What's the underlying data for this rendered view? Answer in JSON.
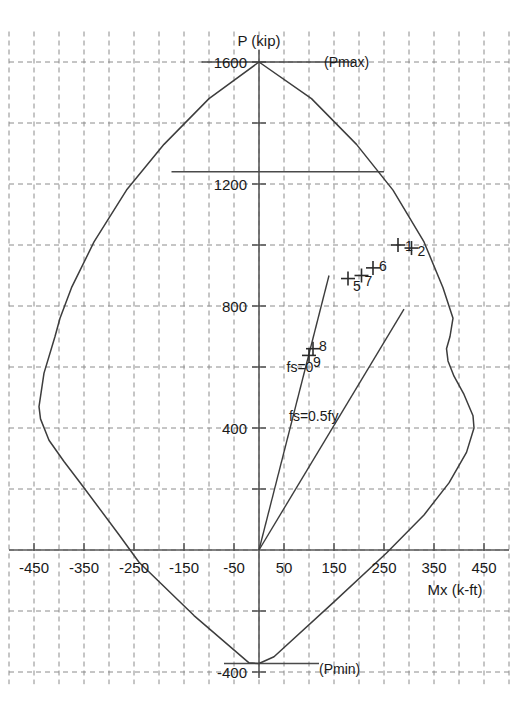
{
  "chart_data": {
    "type": "line",
    "title": "",
    "xlabel": "Mx (k-ft)",
    "ylabel": "P (kip)",
    "xlim": [
      -500,
      500
    ],
    "ylim": [
      -440,
      1700
    ],
    "grid": true,
    "legend_position": "none",
    "x_ticks": [
      -450,
      -350,
      -250,
      -150,
      -50,
      50,
      150,
      250,
      350,
      450
    ],
    "x_tick_labels": [
      "-450",
      "-350",
      "-250",
      "-150",
      "-50",
      "50",
      "150",
      "250",
      "350",
      "450"
    ],
    "y_ticks": [
      1600,
      1200,
      800,
      400,
      -400
    ],
    "y_tick_labels": [
      "1600",
      "1200",
      "800",
      "400",
      "-400"
    ],
    "x_minor_step": 50,
    "y_minor_step": 200,
    "annotations": [
      {
        "name": "pmax-label",
        "text": "(Pmax)",
        "x": 130,
        "y": 1600
      },
      {
        "name": "pmin-label",
        "text": "(Pmin)",
        "x": 120,
        "y": -390
      },
      {
        "name": "fs0-label",
        "text": "fs=0",
        "x": 55,
        "y": 600
      },
      {
        "name": "fs05fy-label",
        "text": "fs=0.5fy",
        "x": 60,
        "y": 440
      }
    ],
    "cap_lines": [
      {
        "name": "pmax-cap-line",
        "y": 1600,
        "x_start": -115,
        "x_end": 190
      },
      {
        "name": "phi-pn-cap-line",
        "y": 1240,
        "x_start": -175,
        "x_end": 250
      },
      {
        "name": "pmin-cap-line",
        "y": -372,
        "x_start": -70,
        "x_end": 120
      }
    ],
    "rays": [
      {
        "name": "fs-equal-zero-ray",
        "label": "fs=0",
        "x_start": 0,
        "y_start": 0,
        "x_end": 140,
        "y_end": 900
      },
      {
        "name": "fs-half-fy-ray",
        "label": "fs=0.5fy",
        "x_start": 0,
        "y_start": 0,
        "x_end": 290,
        "y_end": 790
      }
    ],
    "series": [
      {
        "name": "interaction-diagram-envelope",
        "closed": true,
        "points": [
          [
            0,
            1600
          ],
          [
            -100,
            1480
          ],
          [
            -190,
            1330
          ],
          [
            -265,
            1180
          ],
          [
            -330,
            1010
          ],
          [
            -375,
            860
          ],
          [
            -398,
            760
          ],
          [
            -408,
            700
          ],
          [
            -430,
            580
          ],
          [
            -440,
            470
          ],
          [
            -437,
            430
          ],
          [
            -420,
            360
          ],
          [
            -390,
            290
          ],
          [
            -355,
            215
          ],
          [
            -280,
            50
          ],
          [
            -240,
            -40
          ],
          [
            -130,
            -215
          ],
          [
            -20,
            -370
          ],
          [
            0,
            -372
          ],
          [
            30,
            -350
          ],
          [
            150,
            -170
          ],
          [
            255,
            -10
          ],
          [
            330,
            115
          ],
          [
            380,
            220
          ],
          [
            415,
            320
          ],
          [
            430,
            400
          ],
          [
            428,
            440
          ],
          [
            410,
            510
          ],
          [
            390,
            570
          ],
          [
            378,
            620
          ],
          [
            375,
            660
          ],
          [
            382,
            700
          ],
          [
            388,
            760
          ],
          [
            368,
            860
          ],
          [
            330,
            1010
          ],
          [
            268,
            1180
          ],
          [
            195,
            1330
          ],
          [
            105,
            1480
          ],
          [
            0,
            1600
          ]
        ]
      }
    ],
    "data_points": [
      {
        "label": "1",
        "x": 278,
        "y": 1000,
        "label_dx": 7,
        "label_dy": 6
      },
      {
        "label": "2",
        "x": 305,
        "y": 990,
        "label_dx": 6,
        "label_dy": 8
      },
      {
        "label": "5",
        "x": 178,
        "y": 890,
        "label_dx": 5,
        "label_dy": 12
      },
      {
        "label": "6",
        "x": 228,
        "y": 925,
        "label_dx": 6,
        "label_dy": 3
      },
      {
        "label": "7",
        "x": 205,
        "y": 900,
        "label_dx": 3,
        "label_dy": 10
      },
      {
        "label": "8",
        "x": 108,
        "y": 660,
        "label_dx": 6,
        "label_dy": 2
      },
      {
        "label": "9",
        "x": 100,
        "y": 638,
        "label_dx": 4,
        "label_dy": 12
      }
    ]
  },
  "colors": {
    "grid": "#8c8c8c",
    "axis": "#595959",
    "curve": "#3d3d3d",
    "text": "#1a1a1a",
    "background": "#ffffff"
  }
}
